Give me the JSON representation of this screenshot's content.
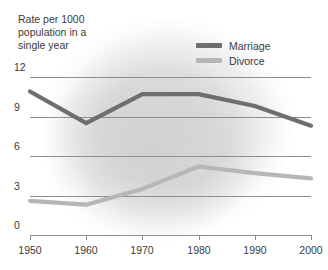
{
  "caption": "Rate per 1000\npopulation in a\nsingle year",
  "legend": {
    "position": "top-right",
    "items": [
      {
        "label": "Marriage",
        "color": "#6e6e6e",
        "name": "legend-item-marriage"
      },
      {
        "label": "Divorce",
        "color": "#b6b6b6",
        "name": "legend-item-divorce"
      }
    ]
  },
  "colors": {
    "marriage": "#6e6e6e",
    "divorce": "#b6b6b6",
    "gridline": "#8e8e8e",
    "text": "#3a3a3a",
    "background": "#ffffff"
  },
  "chart_data": {
    "type": "line",
    "title": "Rate per 1000 population in a single year",
    "xlabel": "",
    "ylabel": "Rate per 1000 population in a single year",
    "x": [
      1950,
      1960,
      1970,
      1980,
      1990,
      2000
    ],
    "categories": [
      "1950",
      "1960",
      "1970",
      "1980",
      "1990",
      "2000"
    ],
    "xticklabels": [
      "1950",
      "1960",
      "1970",
      "1980",
      "1990",
      "2000"
    ],
    "yticklabels": [
      "0",
      "3",
      "6",
      "9",
      "12"
    ],
    "yticks": [
      0,
      3,
      6,
      9,
      12
    ],
    "xlim": [
      1950,
      2000
    ],
    "ylim": [
      0,
      12
    ],
    "grid": "horizontal",
    "legend_position": "top-right",
    "series": [
      {
        "name": "Marriage",
        "color": "#6e6e6e",
        "values": [
          10.9,
          8.5,
          10.7,
          10.7,
          9.8,
          8.3
        ]
      },
      {
        "name": "Divorce",
        "color": "#b6b6b6",
        "values": [
          2.6,
          2.3,
          3.5,
          5.2,
          4.7,
          4.3
        ]
      }
    ]
  }
}
